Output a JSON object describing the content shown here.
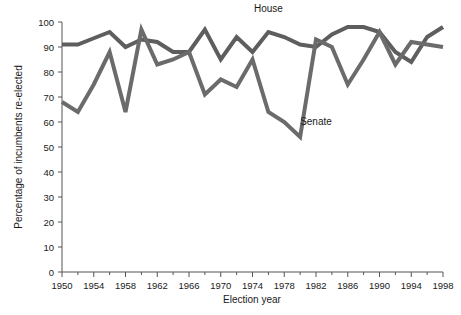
{
  "chart_data": {
    "type": "line",
    "title": "",
    "xlabel": "Election year",
    "ylabel": "Percentage of incumbents re-elected",
    "xlim": [
      1950,
      1998
    ],
    "ylim": [
      0,
      100
    ],
    "grid": false,
    "legend_position": "inline-annotations",
    "x": [
      1950,
      1952,
      1954,
      1956,
      1958,
      1960,
      1962,
      1964,
      1966,
      1968,
      1970,
      1972,
      1974,
      1976,
      1978,
      1980,
      1982,
      1984,
      1986,
      1988,
      1990,
      1992,
      1994,
      1996,
      1998
    ],
    "xtick_labels": [
      "1950",
      "1954",
      "1958",
      "1962",
      "1966",
      "1970",
      "1974",
      "1978",
      "1982",
      "1986",
      "1990",
      "1994",
      "1998"
    ],
    "xtick_values": [
      1950,
      1954,
      1958,
      1962,
      1966,
      1970,
      1974,
      1978,
      1982,
      1986,
      1990,
      1994,
      1998
    ],
    "xtick_minor_values": [
      1952,
      1956,
      1960,
      1964,
      1968,
      1972,
      1976,
      1980,
      1984,
      1988,
      1992,
      1996
    ],
    "ytick_labels": [
      "0",
      "10",
      "20",
      "30",
      "40",
      "50",
      "60",
      "70",
      "80",
      "90",
      "100"
    ],
    "ytick_values": [
      0,
      10,
      20,
      30,
      40,
      50,
      60,
      70,
      80,
      90,
      100
    ],
    "series": [
      {
        "name": "House",
        "label": "House",
        "color": "#5e5e5e",
        "stroke_width": 4,
        "label_x": 1976,
        "label_y": 104,
        "values": [
          91,
          91,
          93.5,
          96,
          90,
          93,
          92,
          88,
          88,
          97,
          85,
          94,
          88,
          96,
          94,
          91,
          90,
          95,
          98,
          98,
          96,
          88,
          84,
          94,
          98
        ]
      },
      {
        "name": "Senate",
        "label": "Senate",
        "color": "#6b6b6b",
        "stroke_width": 4,
        "label_x": 1982,
        "label_y": 59,
        "values": [
          68,
          64,
          75,
          88,
          64,
          97,
          83,
          85,
          88,
          71,
          77,
          74,
          85,
          64,
          60,
          54,
          93,
          90,
          75,
          85,
          96,
          83,
          92,
          91,
          90
        ]
      }
    ]
  }
}
